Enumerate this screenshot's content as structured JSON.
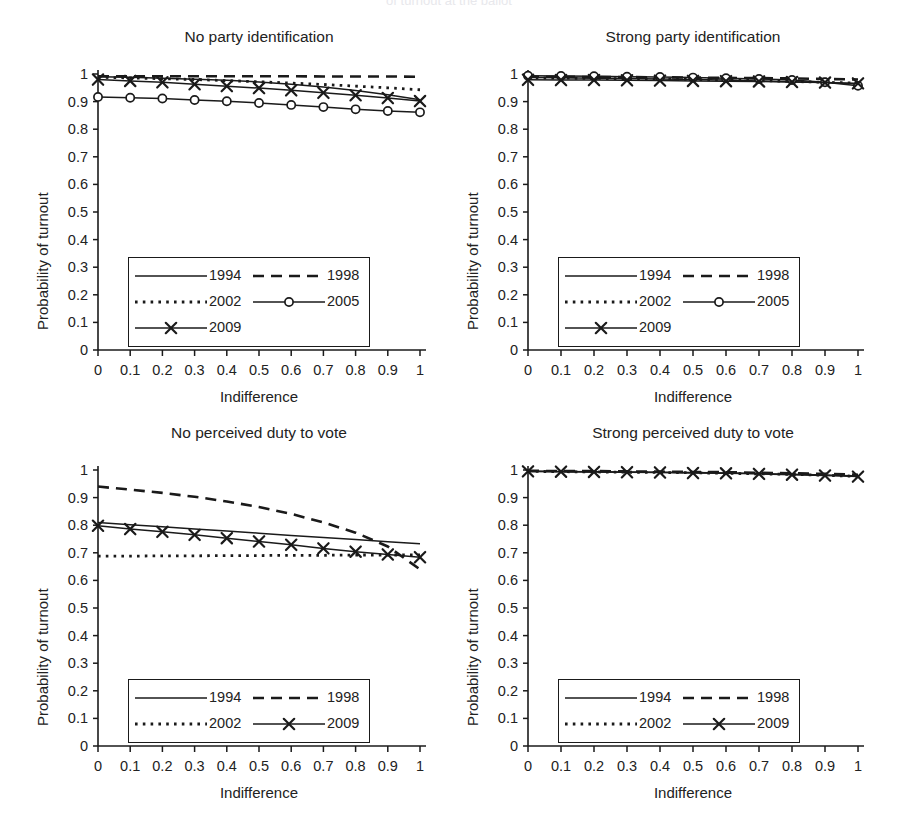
{
  "figure": {
    "supertitle": "of turnout at the ballot",
    "xlabel": "Indifference",
    "ylabel": "Probability of turnout",
    "ytick_labels": [
      "1",
      "0.9",
      "0.8",
      "0.7",
      "0.6",
      "0.5",
      "0.4",
      "0.3",
      "0.2",
      "0.1",
      "0"
    ],
    "xtick_labels": [
      "0",
      "0.1",
      "0.2",
      "0.3",
      "0.4",
      "0.5",
      "0.6",
      "0.7",
      "0.8",
      "0.9",
      "1"
    ],
    "axis_color": "#1a1a1a",
    "line_color": "#1a1a1a"
  },
  "chart_data": [
    {
      "type": "line",
      "panel_id": "no-party-identification",
      "title": "No party identification",
      "xlabel": "Indifference",
      "ylabel": "Probability of turnout",
      "x": [
        0,
        0.1,
        0.2,
        0.3,
        0.4,
        0.5,
        0.6,
        0.7,
        0.8,
        0.9,
        1
      ],
      "xlim": [
        0,
        1
      ],
      "ylim": [
        0,
        1
      ],
      "grid": false,
      "legend_position": "lower-left",
      "series": [
        {
          "name": "1994",
          "style": "solid",
          "marker": "none",
          "values": [
            0.99,
            0.988,
            0.985,
            0.981,
            0.977,
            0.971,
            0.963,
            0.953,
            0.94,
            0.925,
            0.907
          ]
        },
        {
          "name": "1998",
          "style": "dashed",
          "marker": "none",
          "values": [
            0.992,
            0.992,
            0.992,
            0.992,
            0.992,
            0.992,
            0.992,
            0.991,
            0.991,
            0.991,
            0.99
          ]
        },
        {
          "name": "2002",
          "style": "dotted",
          "marker": "none",
          "values": [
            0.988,
            0.986,
            0.983,
            0.98,
            0.976,
            0.972,
            0.967,
            0.962,
            0.956,
            0.95,
            0.943
          ]
        },
        {
          "name": "2005",
          "style": "solid",
          "marker": "circle",
          "values": [
            0.917,
            0.914,
            0.911,
            0.906,
            0.901,
            0.895,
            0.888,
            0.88,
            0.872,
            0.866,
            0.861
          ]
        },
        {
          "name": "2009",
          "style": "solid",
          "marker": "cross",
          "values": [
            0.98,
            0.975,
            0.97,
            0.963,
            0.956,
            0.949,
            0.941,
            0.932,
            0.923,
            0.913,
            0.902
          ]
        }
      ]
    },
    {
      "type": "line",
      "panel_id": "strong-party-identification",
      "title": "Strong party identification",
      "xlabel": "Indifference",
      "ylabel": "Probability of turnout",
      "x": [
        0,
        0.1,
        0.2,
        0.3,
        0.4,
        0.5,
        0.6,
        0.7,
        0.8,
        0.9,
        1
      ],
      "xlim": [
        0,
        1
      ],
      "ylim": [
        0,
        1
      ],
      "grid": false,
      "legend_position": "lower-left",
      "series": [
        {
          "name": "1994",
          "style": "solid",
          "marker": "none",
          "values": [
            0.987,
            0.986,
            0.985,
            0.984,
            0.982,
            0.98,
            0.978,
            0.975,
            0.972,
            0.969,
            0.965
          ]
        },
        {
          "name": "1998",
          "style": "dashed",
          "marker": "none",
          "values": [
            0.99,
            0.99,
            0.989,
            0.989,
            0.988,
            0.987,
            0.986,
            0.985,
            0.984,
            0.982,
            0.98
          ]
        },
        {
          "name": "2002",
          "style": "dotted",
          "marker": "none",
          "values": [
            0.986,
            0.985,
            0.984,
            0.983,
            0.982,
            0.98,
            0.978,
            0.976,
            0.973,
            0.97,
            0.967
          ]
        },
        {
          "name": "2005",
          "style": "solid",
          "marker": "circle",
          "values": [
            0.994,
            0.993,
            0.992,
            0.99,
            0.989,
            0.987,
            0.985,
            0.982,
            0.978,
            0.97,
            0.957
          ]
        },
        {
          "name": "2009",
          "style": "solid",
          "marker": "cross",
          "values": [
            0.979,
            0.978,
            0.978,
            0.977,
            0.976,
            0.975,
            0.974,
            0.973,
            0.971,
            0.969,
            0.966
          ]
        }
      ]
    },
    {
      "type": "line",
      "panel_id": "no-perceived-duty-to-vote",
      "title": "No perceived duty to vote",
      "xlabel": "Indifference",
      "ylabel": "Probability of turnout",
      "x": [
        0,
        0.1,
        0.2,
        0.3,
        0.4,
        0.5,
        0.6,
        0.7,
        0.8,
        0.9,
        1
      ],
      "xlim": [
        0,
        1
      ],
      "ylim": [
        0,
        1
      ],
      "grid": false,
      "legend_position": "lower-left",
      "series": [
        {
          "name": "1994",
          "style": "solid",
          "marker": "none",
          "values": [
            0.81,
            0.802,
            0.794,
            0.786,
            0.779,
            0.771,
            0.763,
            0.755,
            0.748,
            0.74,
            0.733
          ]
        },
        {
          "name": "1998",
          "style": "dashed",
          "marker": "none",
          "values": [
            0.94,
            0.929,
            0.917,
            0.903,
            0.886,
            0.866,
            0.841,
            0.81,
            0.773,
            0.723,
            0.64
          ]
        },
        {
          "name": "2002",
          "style": "dotted",
          "marker": "none",
          "values": [
            0.688,
            0.688,
            0.689,
            0.689,
            0.69,
            0.69,
            0.691,
            0.691,
            0.692,
            0.692,
            0.692
          ]
        },
        {
          "name": "2009",
          "style": "solid",
          "marker": "cross",
          "values": [
            0.798,
            0.786,
            0.776,
            0.765,
            0.753,
            0.741,
            0.729,
            0.716,
            0.704,
            0.694,
            0.684
          ]
        }
      ]
    },
    {
      "type": "line",
      "panel_id": "strong-perceived-duty-to-vote",
      "title": "Strong perceived duty to vote",
      "xlabel": "Indifference",
      "ylabel": "Probability of turnout",
      "x": [
        0,
        0.1,
        0.2,
        0.3,
        0.4,
        0.5,
        0.6,
        0.7,
        0.8,
        0.9,
        1
      ],
      "xlim": [
        0,
        1
      ],
      "ylim": [
        0,
        1
      ],
      "grid": false,
      "legend_position": "lower-left",
      "series": [
        {
          "name": "1994",
          "style": "solid",
          "marker": "none",
          "values": [
            0.996,
            0.995,
            0.994,
            0.993,
            0.992,
            0.991,
            0.989,
            0.987,
            0.985,
            0.982,
            0.978
          ]
        },
        {
          "name": "1998",
          "style": "dashed",
          "marker": "none",
          "values": [
            0.997,
            0.996,
            0.996,
            0.995,
            0.994,
            0.993,
            0.992,
            0.99,
            0.988,
            0.986,
            0.983
          ]
        },
        {
          "name": "2002",
          "style": "dotted",
          "marker": "none",
          "values": [
            0.995,
            0.994,
            0.993,
            0.992,
            0.991,
            0.99,
            0.988,
            0.986,
            0.984,
            0.981,
            0.977
          ]
        },
        {
          "name": "2009",
          "style": "solid",
          "marker": "cross",
          "values": [
            0.995,
            0.994,
            0.993,
            0.992,
            0.991,
            0.989,
            0.988,
            0.986,
            0.983,
            0.98,
            0.976
          ]
        }
      ]
    }
  ],
  "legends": [
    {
      "panel_id": "no-party-identification",
      "entries": [
        {
          "label": "1994",
          "style": "solid",
          "marker": "none"
        },
        {
          "label": "1998",
          "style": "dashed",
          "marker": "none"
        },
        {
          "label": "2002",
          "style": "dotted",
          "marker": "none"
        },
        {
          "label": "2005",
          "style": "solid",
          "marker": "circle"
        },
        {
          "label": "2009",
          "style": "solid",
          "marker": "cross"
        }
      ]
    },
    {
      "panel_id": "strong-party-identification",
      "entries": [
        {
          "label": "1994",
          "style": "solid",
          "marker": "none"
        },
        {
          "label": "1998",
          "style": "dashed",
          "marker": "none"
        },
        {
          "label": "2002",
          "style": "dotted",
          "marker": "none"
        },
        {
          "label": "2005",
          "style": "solid",
          "marker": "circle"
        },
        {
          "label": "2009",
          "style": "solid",
          "marker": "cross"
        }
      ]
    },
    {
      "panel_id": "no-perceived-duty-to-vote",
      "entries": [
        {
          "label": "1994",
          "style": "solid",
          "marker": "none"
        },
        {
          "label": "1998",
          "style": "dashed",
          "marker": "none"
        },
        {
          "label": "2002",
          "style": "dotted",
          "marker": "none"
        },
        {
          "label": "2009",
          "style": "solid",
          "marker": "cross"
        }
      ]
    },
    {
      "panel_id": "strong-perceived-duty-to-vote",
      "entries": [
        {
          "label": "1994",
          "style": "solid",
          "marker": "none"
        },
        {
          "label": "1998",
          "style": "dashed",
          "marker": "none"
        },
        {
          "label": "2002",
          "style": "dotted",
          "marker": "none"
        },
        {
          "label": "2009",
          "style": "solid",
          "marker": "cross"
        }
      ]
    }
  ]
}
